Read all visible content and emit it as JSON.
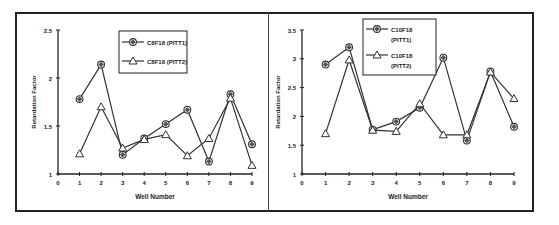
{
  "chart_data": [
    {
      "type": "line",
      "title": "",
      "xlabel": "Well Number",
      "ylabel": "Retardation Factor",
      "x": [
        1,
        2,
        3,
        4,
        5,
        6,
        7,
        8,
        9
      ],
      "xlim": [
        0,
        9
      ],
      "ylim": [
        1,
        2.5
      ],
      "xticks": [
        "0",
        "1",
        "2",
        "3",
        "4",
        "5",
        "6",
        "7",
        "8",
        "9"
      ],
      "yticks": [
        "1",
        "1.5",
        "2",
        "2.5"
      ],
      "grid": false,
      "legend_position": "top-center",
      "series": [
        {
          "name": "C8F18 (PITT1)",
          "marker": "diamond-circle",
          "values": [
            1.78,
            2.14,
            1.2,
            1.37,
            1.52,
            1.67,
            1.13,
            1.83,
            1.31
          ]
        },
        {
          "name": "C8F18 (PITT2)",
          "marker": "triangle",
          "values": [
            1.21,
            1.7,
            1.27,
            1.36,
            1.41,
            1.19,
            1.37,
            1.79,
            1.09
          ]
        }
      ]
    },
    {
      "type": "line",
      "title": "",
      "xlabel": "Well Number",
      "ylabel": "Retardation Factor",
      "x": [
        1,
        2,
        3,
        4,
        5,
        6,
        7,
        8,
        9
      ],
      "xlim": [
        0,
        9
      ],
      "ylim": [
        1,
        3.5
      ],
      "xticks": [
        "0",
        "1",
        "2",
        "3",
        "4",
        "5",
        "6",
        "7",
        "8",
        "9"
      ],
      "yticks": [
        "1",
        "1.5",
        "2",
        "2.5",
        "3",
        "3.5"
      ],
      "grid": false,
      "legend_position": "top-center",
      "series": [
        {
          "name": "C10F18 (PITT1)",
          "legend_lines": [
            "C10F18",
            "(PITT1)"
          ],
          "marker": "diamond-circle",
          "values": [
            2.9,
            3.2,
            1.77,
            1.91,
            2.15,
            3.02,
            1.58,
            2.78,
            1.82
          ]
        },
        {
          "name": "C10F18 (PITT2)",
          "legend_lines": [
            "C10F18",
            "(PITT2)"
          ],
          "marker": "triangle",
          "values": [
            1.7,
            2.98,
            1.76,
            1.74,
            2.22,
            1.68,
            1.68,
            2.77,
            2.31
          ]
        }
      ]
    }
  ]
}
